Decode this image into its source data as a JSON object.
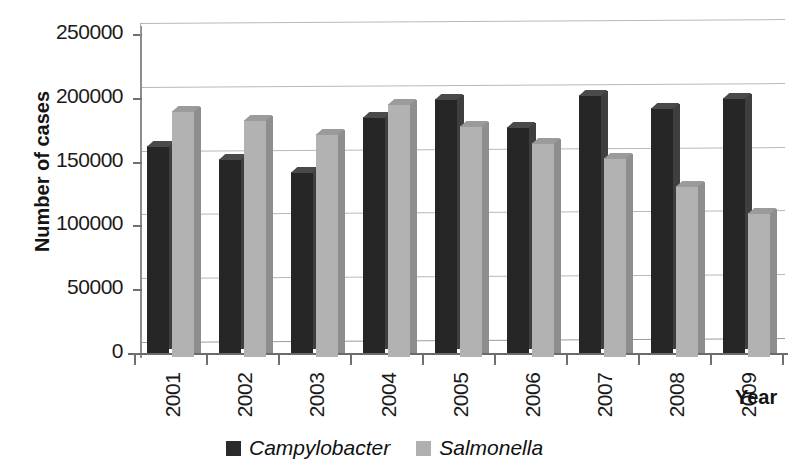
{
  "chart_data": {
    "type": "bar",
    "title": "",
    "subtitle": "",
    "xlabel": "Year",
    "ylabel": "Number of cases",
    "categories": [
      "2001",
      "2002",
      "2003",
      "2004",
      "2005",
      "2006",
      "2007",
      "2008",
      "2009"
    ],
    "series": [
      {
        "name": "Campylobacter",
        "color": "#262626",
        "values": [
          162000,
          152000,
          142000,
          185000,
          199000,
          177000,
          202000,
          192000,
          200000
        ]
      },
      {
        "name": "Salmonella",
        "color": "#b2b2b2",
        "values": [
          193000,
          186000,
          175000,
          198000,
          181000,
          168000,
          156000,
          134000,
          113000
        ]
      }
    ],
    "ylim": [
      0,
      250000
    ],
    "ytick_labels": [
      "0",
      "50000",
      "100000",
      "150000",
      "200000",
      "250000"
    ],
    "ytick_values": [
      0,
      50000,
      100000,
      150000,
      200000,
      250000
    ],
    "grid": true,
    "grid_axis": "y",
    "legend_position": "bottom",
    "style": "3d-column",
    "annotations": []
  },
  "axes": {
    "y_title": "Number of cases",
    "x_title": "Year"
  },
  "legend": {
    "items": [
      {
        "label": "Campylobacter",
        "swatch": "dark-square-swatch"
      },
      {
        "label": "Salmonella",
        "swatch": "light-square-swatch"
      }
    ]
  }
}
